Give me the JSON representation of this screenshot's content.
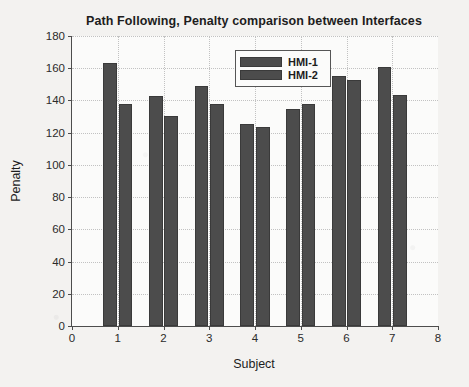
{
  "chart_data": {
    "type": "bar",
    "title": "Path Following, Penalty comparison between Interfaces",
    "xlabel": "Subject",
    "ylabel": "Penalty",
    "categories": [
      "1",
      "2",
      "3",
      "4",
      "5",
      "6",
      "7"
    ],
    "series": [
      {
        "name": "HMI-1",
        "values": [
          163.5,
          142.5,
          149,
          125.5,
          134.5,
          155,
          161
        ]
      },
      {
        "name": "HMI-2",
        "values": [
          137.5,
          130.5,
          138,
          123.5,
          138,
          153,
          143.5
        ]
      }
    ],
    "xlim": [
      0,
      8
    ],
    "ylim": [
      0,
      180
    ],
    "xticks": [
      "0",
      "1",
      "2",
      "3",
      "4",
      "5",
      "6",
      "7",
      "8"
    ],
    "yticks": [
      "0",
      "20",
      "40",
      "60",
      "80",
      "100",
      "120",
      "140",
      "160",
      "180"
    ],
    "grid": true,
    "legend_position": "top-center",
    "bar_color": "#4c4c4c",
    "background_color": "#f3f2f0"
  }
}
